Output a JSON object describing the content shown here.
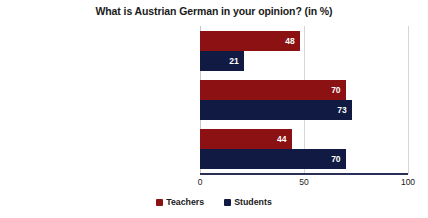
{
  "chart_data": {
    "type": "bar",
    "orientation": "horizontal",
    "title": "What is Austrian German in your opinion? (in %)",
    "xlabel": "",
    "ylabel": "",
    "xlim": [
      0,
      100
    ],
    "ticks": [
      "0",
      "50",
      "100"
    ],
    "tick_values": [
      0,
      50,
      100
    ],
    "grid": true,
    "legend_position": "bottom",
    "categories": [
      "the language used in television and radio news broadcasting",
      "colloquial language (“Umgangssprache”)",
      "dialects spoken in Austria"
    ],
    "series": [
      {
        "name": "Teachers",
        "color": "#8B1113",
        "values": [
          48,
          70,
          44
        ]
      },
      {
        "name": "Students",
        "color": "#101A42",
        "values": [
          21,
          73,
          70
        ]
      }
    ]
  }
}
